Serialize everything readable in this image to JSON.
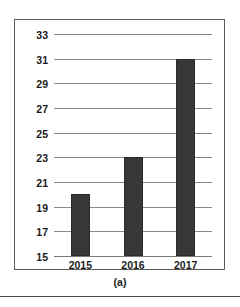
{
  "figure": {
    "caption": "(a)"
  },
  "chart_data": {
    "type": "bar",
    "title": "",
    "subtitle": "",
    "xlabel": "",
    "ylabel": "",
    "categories": [
      "2015",
      "2016",
      "2017"
    ],
    "values": [
      20,
      23,
      31
    ],
    "series": [
      {
        "name": "",
        "values": [
          20,
          23,
          31
        ]
      }
    ],
    "ylim": [
      15,
      33
    ],
    "ytick_step": 2,
    "yticks": [
      33,
      31,
      29,
      27,
      25,
      23,
      21,
      19,
      17,
      15
    ],
    "xticks": [
      "2015",
      "2016",
      "2017"
    ],
    "grid": "horizontal",
    "legend": "none",
    "bar_color": "#383838",
    "gridline_color": "#8a8a8a",
    "frame_color": "#5a5a5a",
    "background_color": "#ffffff"
  }
}
